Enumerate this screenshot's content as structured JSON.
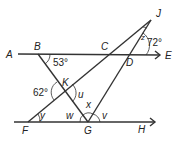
{
  "diagram": {
    "points": {
      "A": "A",
      "B": "B",
      "C": "C",
      "D": "D",
      "E": "E",
      "F": "F",
      "G": "G",
      "H": "H",
      "J": "J",
      "K": "K"
    },
    "angles": {
      "B": "53°",
      "J_ext": "72°",
      "K": "62°",
      "z": "z",
      "u": "u",
      "x": "x",
      "w": "w",
      "v": "v",
      "y": "y"
    },
    "lines": [
      "AE",
      "FH",
      "BG",
      "FJ",
      "GJ"
    ]
  }
}
